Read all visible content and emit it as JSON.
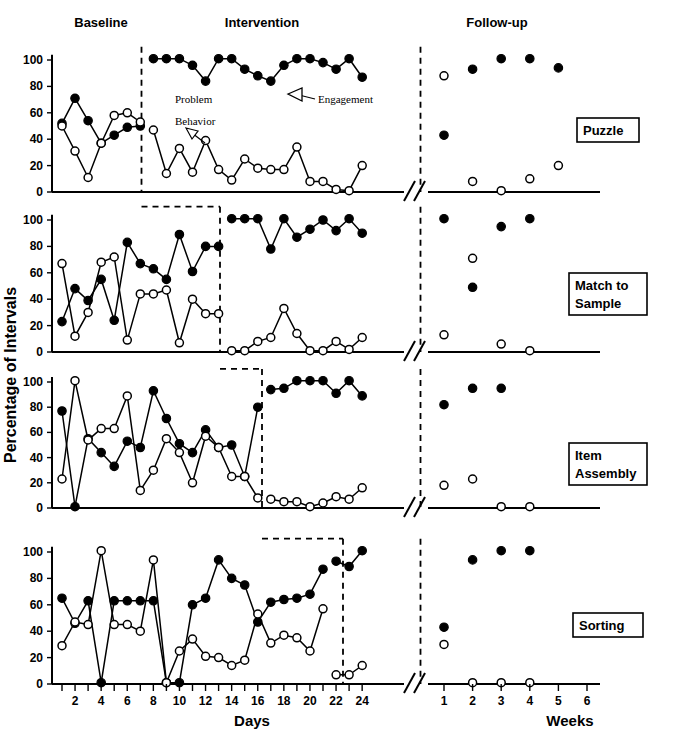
{
  "figure": {
    "y_axis_label": "Percentage of Intervals",
    "x_axis_label_days": "Days",
    "x_axis_label_weeks": "Weeks",
    "phase_headers": [
      "Baseline",
      "Intervention",
      "Follow-up"
    ],
    "annotations": [
      {
        "name": "problem-behavior",
        "line1": "Problem",
        "line2": "Behavior"
      },
      {
        "name": "engagement",
        "line1": "Engagement",
        "line2": ""
      }
    ],
    "panel_labels": [
      "Puzzle",
      "Match to\nSample",
      "Item\nAssembly",
      "Sorting"
    ],
    "y_ticks": [
      0,
      20,
      40,
      60,
      80,
      100
    ],
    "day_ticks": [
      2,
      4,
      6,
      8,
      10,
      12,
      14,
      16,
      18,
      20,
      22,
      24
    ],
    "week_ticks": [
      1,
      2,
      3,
      4,
      5,
      6
    ],
    "colors": {
      "ink": "#000000",
      "paper": "#ffffff"
    }
  },
  "chart_data": [
    {
      "type": "line",
      "title": "Puzzle",
      "xlabel": "Days",
      "ylabel": "Percentage of Intervals",
      "ylim": [
        0,
        100
      ],
      "grid": false,
      "legend": [
        "Engagement",
        "Problem Behavior"
      ],
      "phases": {
        "baseline": [
          1,
          7
        ],
        "intervention": [
          8,
          24
        ],
        "followup_weeks": [
          1,
          6
        ]
      },
      "series": [
        {
          "name": "Engagement",
          "marker": "closed-circle",
          "baseline_x": [
            1,
            2,
            3,
            4,
            5,
            6,
            7
          ],
          "baseline_values": [
            52,
            71,
            54,
            37,
            43,
            49,
            50
          ],
          "intervention_x": [
            8,
            9,
            10,
            11,
            12,
            13,
            14,
            15,
            16,
            17,
            18,
            19,
            20,
            21,
            22,
            23,
            24
          ],
          "intervention_values": [
            101,
            101,
            101,
            96,
            84,
            101,
            101,
            93,
            88,
            84,
            96,
            101,
            101,
            98,
            93,
            101,
            87
          ],
          "followup_weeks": [
            1,
            2,
            3,
            4,
            5,
            6
          ],
          "followup_values": [
            43,
            93,
            101,
            101,
            94,
            null
          ]
        },
        {
          "name": "Problem Behavior",
          "marker": "open-circle",
          "baseline_x": [
            1,
            2,
            3,
            4,
            5,
            6,
            7
          ],
          "baseline_values": [
            50,
            31,
            11,
            37,
            58,
            60,
            53
          ],
          "intervention_x": [
            8,
            9,
            10,
            11,
            12,
            13,
            14,
            15,
            16,
            17,
            18,
            19,
            20,
            21,
            22,
            23,
            24
          ],
          "intervention_values": [
            47,
            14,
            33,
            15,
            39,
            17,
            9,
            25,
            18,
            17,
            17,
            34,
            8,
            8,
            2,
            1,
            20
          ],
          "followup_weeks": [
            1,
            2,
            3,
            4,
            5,
            6
          ],
          "followup_values": [
            88,
            8,
            1,
            10,
            20,
            null
          ]
        }
      ]
    },
    {
      "type": "line",
      "title": "Match to Sample",
      "xlabel": "Days",
      "ylabel": "Percentage of Intervals",
      "ylim": [
        0,
        100
      ],
      "grid": false,
      "legend": [
        "Engagement",
        "Problem Behavior"
      ],
      "phases": {
        "baseline": [
          1,
          13
        ],
        "intervention": [
          14,
          24
        ],
        "followup_weeks": [
          1,
          6
        ]
      },
      "series": [
        {
          "name": "Engagement",
          "marker": "closed-circle",
          "baseline_x": [
            1,
            2,
            3,
            4,
            5,
            6,
            7,
            8,
            9,
            10,
            11,
            12,
            13
          ],
          "baseline_values": [
            23,
            48,
            39,
            55,
            24,
            83,
            67,
            63,
            55,
            89,
            61,
            80,
            80
          ],
          "intervention_x": [
            14,
            15,
            16,
            17,
            18,
            19,
            20,
            21,
            22,
            23,
            24
          ],
          "intervention_values": [
            101,
            101,
            101,
            78,
            101,
            87,
            93,
            100,
            92,
            101,
            90
          ],
          "followup_weeks": [
            1,
            2,
            3,
            4,
            5,
            6
          ],
          "followup_values": [
            101,
            49,
            95,
            101,
            null,
            null
          ]
        },
        {
          "name": "Problem Behavior",
          "marker": "open-circle",
          "baseline_x": [
            1,
            2,
            3,
            4,
            5,
            6,
            7,
            8,
            9,
            10,
            11,
            12,
            13
          ],
          "baseline_values": [
            67,
            12,
            30,
            68,
            72,
            9,
            44,
            44,
            47,
            7,
            40,
            29,
            29
          ],
          "intervention_x": [
            14,
            15,
            16,
            17,
            18,
            19,
            20,
            21,
            22,
            23,
            24
          ],
          "intervention_values": [
            1,
            1,
            8,
            11,
            33,
            14,
            1,
            1,
            8,
            2,
            11
          ],
          "followup_weeks": [
            1,
            2,
            3,
            4,
            5,
            6
          ],
          "followup_values": [
            13,
            71,
            6,
            1,
            null,
            null
          ]
        }
      ]
    },
    {
      "type": "line",
      "title": "Item Assembly",
      "xlabel": "Days",
      "ylabel": "Percentage of Intervals",
      "ylim": [
        0,
        100
      ],
      "grid": false,
      "legend": [
        "Engagement",
        "Problem Behavior"
      ],
      "phases": {
        "baseline": [
          1,
          16
        ],
        "intervention": [
          17,
          24
        ],
        "followup_weeks": [
          1,
          6
        ]
      },
      "series": [
        {
          "name": "Engagement",
          "marker": "closed-circle",
          "baseline_x": [
            1,
            2,
            3,
            4,
            5,
            6,
            7,
            8,
            9,
            10,
            11,
            12,
            13,
            14,
            15,
            16
          ],
          "baseline_values": [
            77,
            1,
            55,
            44,
            33,
            53,
            48,
            93,
            71,
            51,
            44,
            62,
            48,
            50,
            25,
            80
          ],
          "intervention_x": [
            17,
            18,
            19,
            20,
            21,
            22,
            23,
            24
          ],
          "intervention_values": [
            94,
            95,
            101,
            101,
            101,
            91,
            101,
            89
          ],
          "followup_weeks": [
            1,
            2,
            3,
            4,
            5,
            6
          ],
          "followup_values": [
            82,
            95,
            95,
            null,
            null,
            null
          ]
        },
        {
          "name": "Problem Behavior",
          "marker": "open-circle",
          "baseline_x": [
            1,
            2,
            3,
            4,
            5,
            6,
            7,
            8,
            9,
            10,
            11,
            12,
            13,
            14,
            15,
            16
          ],
          "baseline_values": [
            23,
            101,
            54,
            63,
            63,
            89,
            14,
            30,
            55,
            44,
            20,
            57,
            48,
            25,
            25,
            8
          ],
          "intervention_x": [
            17,
            18,
            19,
            20,
            21,
            22,
            23,
            24
          ],
          "intervention_values": [
            7,
            5,
            5,
            1,
            4,
            9,
            7,
            16
          ],
          "followup_weeks": [
            1,
            2,
            3,
            4,
            5,
            6
          ],
          "followup_values": [
            18,
            23,
            1,
            1,
            null,
            null
          ]
        }
      ]
    },
    {
      "type": "line",
      "title": "Sorting",
      "xlabel": "Days",
      "ylabel": "Percentage of Intervals",
      "ylim": [
        0,
        100
      ],
      "grid": false,
      "legend": [
        "Engagement",
        "Problem Behavior"
      ],
      "phases": {
        "baseline": [
          1,
          21
        ],
        "intervention": [
          22,
          24
        ],
        "followup_weeks": [
          1,
          6
        ]
      },
      "series": [
        {
          "name": "Engagement",
          "marker": "closed-circle",
          "baseline_x": [
            1,
            2,
            3,
            4,
            5,
            6,
            7,
            8,
            9,
            10,
            11,
            12,
            13,
            14,
            15,
            16,
            17,
            18,
            19,
            20,
            21
          ],
          "baseline_values": [
            65,
            46,
            63,
            1,
            63,
            63,
            63,
            63,
            1,
            1,
            60,
            65,
            94,
            80,
            75,
            47,
            62,
            64,
            65,
            68,
            87
          ],
          "intervention_x": [
            22,
            23,
            24
          ],
          "intervention_values": [
            93,
            89,
            101
          ],
          "followup_weeks": [
            1,
            2,
            3,
            4,
            5,
            6
          ],
          "followup_values": [
            43,
            94,
            101,
            101,
            null,
            null
          ]
        },
        {
          "name": "Problem Behavior",
          "marker": "open-circle",
          "baseline_x": [
            1,
            2,
            3,
            4,
            5,
            6,
            7,
            8,
            9,
            10,
            11,
            12,
            13,
            14,
            15,
            16,
            17,
            18,
            19,
            20,
            21
          ],
          "baseline_values": [
            29,
            47,
            45,
            101,
            45,
            45,
            40,
            94,
            1,
            25,
            34,
            21,
            20,
            14,
            18,
            53,
            31,
            37,
            35,
            25,
            57
          ],
          "intervention_x": [
            22,
            23,
            24
          ],
          "intervention_values": [
            7,
            7,
            14
          ],
          "followup_weeks": [
            1,
            2,
            3,
            4,
            5,
            6
          ],
          "followup_values": [
            30,
            1,
            1,
            1,
            null,
            null
          ]
        }
      ]
    }
  ]
}
